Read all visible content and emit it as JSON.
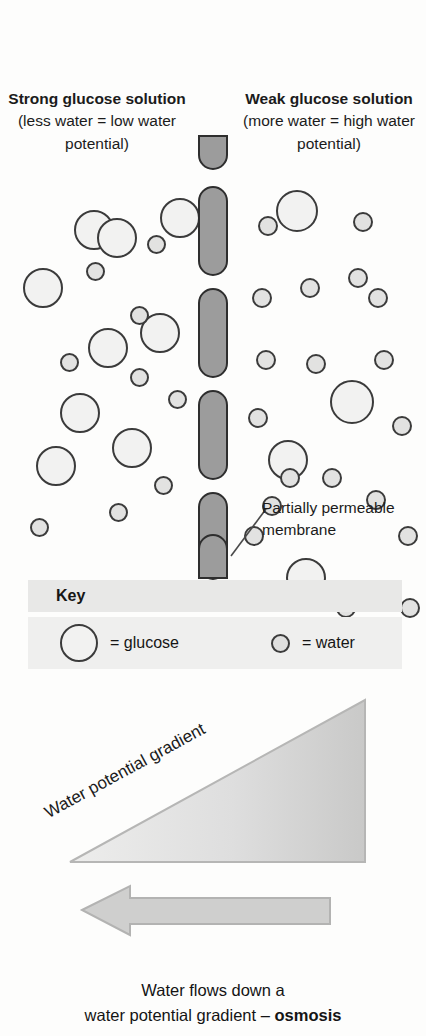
{
  "diagram": {
    "headings": {
      "left": {
        "bold": "Strong glucose solution",
        "paren": "(less water = low water potential)"
      },
      "right": {
        "bold": "Weak glucose solution",
        "paren": "(more water = high water potential)"
      }
    },
    "callout": {
      "label": "Partially permeable membrane"
    },
    "key": {
      "header": "Key",
      "items": [
        {
          "symbol": "large-circle",
          "text": "= glucose"
        },
        {
          "symbol": "small-circle",
          "text": "= water"
        }
      ]
    },
    "gradient": {
      "label": "Water potential gradient"
    },
    "caption": {
      "line1": "Water flows down a",
      "line2_plain": "water potential gradient – ",
      "line2_bold": "osmosis"
    },
    "colors": {
      "membrane_fill": "#9c9c9c",
      "membrane_stroke": "#2e2e2e",
      "glucose_fill": "#f2f2f1",
      "water_fill": "#e0e0df",
      "molecule_stroke": "#3b3b3b",
      "key_header_bg": "#e8e8e7",
      "key_body_bg": "#efefee",
      "wedge_fill_light": "#ededec",
      "wedge_fill_dark": "#c9c9c8",
      "arrow_fill": "#cfcfce",
      "text": "#1a1a1a"
    },
    "molecules": {
      "left_glucose": [
        [
          74,
          82,
          40
        ],
        [
          23,
          140,
          40
        ],
        [
          97,
          90,
          40
        ],
        [
          88,
          200,
          40
        ],
        [
          60,
          265,
          40
        ],
        [
          36,
          318,
          40
        ],
        [
          112,
          300,
          40
        ],
        [
          160,
          70,
          40
        ],
        [
          140,
          185,
          40
        ]
      ],
      "left_water": [
        [
          147,
          107,
          19
        ],
        [
          86,
          134,
          19
        ],
        [
          130,
          178,
          19
        ],
        [
          130,
          240,
          19
        ],
        [
          60,
          225,
          19
        ],
        [
          154,
          348,
          19
        ],
        [
          109,
          375,
          19
        ],
        [
          30,
          390,
          19
        ],
        [
          168,
          262,
          19
        ]
      ],
      "right_glucose": [
        [
          276,
          62,
          42
        ],
        [
          330,
          252,
          44
        ],
        [
          268,
          312,
          40
        ],
        [
          286,
          430,
          40
        ]
      ],
      "right_water": [
        [
          258,
          88,
          20
        ],
        [
          353,
          84,
          20
        ],
        [
          256,
          222,
          20
        ],
        [
          306,
          226,
          20
        ],
        [
          374,
          222,
          20
        ],
        [
          280,
          340,
          20
        ],
        [
          322,
          340,
          20
        ],
        [
          366,
          362,
          20
        ],
        [
          244,
          398,
          20
        ],
        [
          398,
          398,
          20
        ],
        [
          278,
          458,
          20
        ],
        [
          248,
          280,
          20
        ],
        [
          368,
          160,
          20
        ],
        [
          300,
          150,
          20
        ],
        [
          392,
          288,
          20
        ],
        [
          252,
          160,
          20
        ],
        [
          336,
          470,
          20
        ],
        [
          400,
          470,
          20
        ],
        [
          348,
          140,
          20
        ],
        [
          262,
          368,
          20
        ]
      ],
      "membrane_segments": [
        {
          "top": 7,
          "height": 35,
          "shape": "cap-bottom"
        },
        {
          "top": 58,
          "height": 90,
          "shape": "full"
        },
        {
          "top": 160,
          "height": 90,
          "shape": "full"
        },
        {
          "top": 262,
          "height": 90,
          "shape": "full"
        },
        {
          "top": 364,
          "height": 88,
          "shape": "full"
        },
        {
          "top": 406,
          "height": 45,
          "shape": "cap-top"
        }
      ]
    }
  }
}
